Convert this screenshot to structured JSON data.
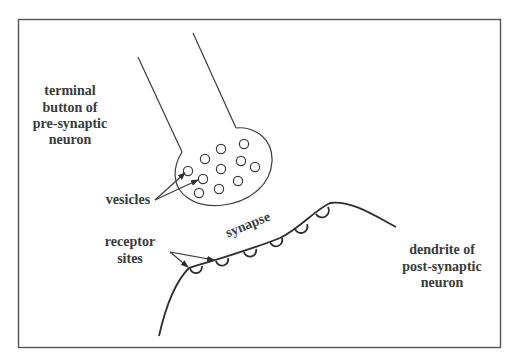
{
  "diagram": {
    "type": "synapse-schematic",
    "labels": {
      "terminal_button": [
        "terminal",
        "button of",
        "pre-synaptic",
        "neuron"
      ],
      "vesicles": "vesicles",
      "synapse": "synapse",
      "receptor_sites": [
        "receptor",
        "sites"
      ],
      "dendrite": [
        "dendrite of",
        "post-synaptic",
        "neuron"
      ]
    },
    "vesicle_count": 11,
    "receptor_count": 6,
    "colors": {
      "line": "#3c3c3c",
      "text": "#3a3a3a",
      "border": "#555555",
      "background": "#ffffff"
    }
  }
}
